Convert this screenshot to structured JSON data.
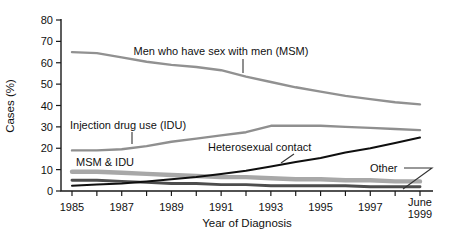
{
  "chart_data": {
    "type": "line",
    "title": "",
    "xlabel": "Year of Diagnosis",
    "ylabel": "Cases (%)",
    "ylim": [
      0,
      80
    ],
    "ytick_step": 10,
    "ytick_labels": [
      "0",
      "10",
      "20",
      "30",
      "40",
      "50",
      "60",
      "70",
      "80"
    ],
    "x": [
      1985,
      1986,
      1987,
      1988,
      1989,
      1990,
      1991,
      1992,
      1993,
      1994,
      1995,
      1996,
      1997,
      1998,
      1999
    ],
    "xtick_label_indices": [
      0,
      2,
      4,
      6,
      8,
      10,
      12,
      14
    ],
    "xtick_labels": [
      "1985",
      "1987",
      "1989",
      "1991",
      "1993",
      "1995",
      "1997",
      "June\n1999"
    ],
    "grid": false,
    "legend_position": "inline-annotations",
    "axis_color": "#1a1a1a",
    "series": [
      {
        "name": "Men who have sex with men (MSM)",
        "key": "msm",
        "color": "#919191",
        "stroke_width": 2.4,
        "values": [
          65,
          64.5,
          62.5,
          60.5,
          59,
          58,
          56.5,
          53.5,
          51,
          48.5,
          46.5,
          44.5,
          43,
          41.5,
          40.5
        ]
      },
      {
        "name": "Injection drug use (IDU)",
        "key": "idu",
        "color": "#8f8f8f",
        "stroke_width": 2.4,
        "values": [
          19,
          19,
          19.5,
          21,
          23,
          24.5,
          26,
          27.5,
          30.5,
          30.5,
          30.5,
          30,
          29.5,
          29,
          28.5
        ]
      },
      {
        "name": "MSM & IDU",
        "key": "msm-idu",
        "color": "#a8a8a8",
        "stroke_width": 4.4,
        "values": [
          9,
          9,
          8.5,
          8,
          7.5,
          7,
          6.5,
          6.5,
          6,
          5.5,
          5.5,
          5,
          5,
          4.5,
          4.5
        ]
      },
      {
        "name": "Other",
        "key": "other",
        "color": "#4d4d4d",
        "stroke_width": 2.9,
        "values": [
          5,
          5,
          4.5,
          4,
          3.5,
          3.5,
          3,
          3,
          2.5,
          2.5,
          2.5,
          2.5,
          2,
          2,
          2
        ]
      },
      {
        "name": "Heterosexual contact",
        "key": "heterosexual",
        "color": "#0f0f0f",
        "stroke_width": 2.0,
        "values": [
          2.5,
          3,
          3.5,
          4.5,
          5.5,
          6.5,
          8,
          9.5,
          11.5,
          13.5,
          15.5,
          18,
          20,
          22.5,
          25
        ]
      }
    ],
    "annotations": [
      {
        "text": "Men who have sex with men (MSM)",
        "x": 221,
        "y": 55,
        "anchor": "middle",
        "leader": [
          [
            243,
            59
          ],
          [
            243,
            73
          ]
        ]
      },
      {
        "text": "Injection drug use (IDU)",
        "x": 70,
        "y": 129,
        "anchor": "start",
        "leader": [
          [
            132,
            132
          ],
          [
            132,
            144
          ]
        ]
      },
      {
        "text": "Heterosexual contact",
        "x": 208,
        "y": 151,
        "anchor": "start",
        "leader": [
          [
            294,
            154
          ],
          [
            281,
            163
          ]
        ]
      },
      {
        "text": "MSM & IDU",
        "x": 76,
        "y": 166,
        "anchor": "start",
        "leader": []
      },
      {
        "text": "Other",
        "x": 370,
        "y": 172,
        "anchor": "start",
        "leader": [
          [
            404,
            168
          ],
          [
            432,
            168
          ],
          [
            403,
            189
          ]
        ]
      }
    ]
  }
}
